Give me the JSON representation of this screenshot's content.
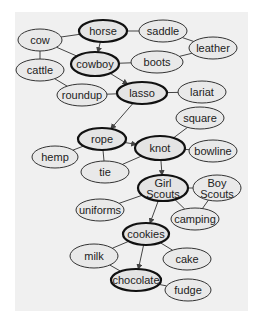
{
  "diagram": {
    "type": "semantic-network",
    "background": "#f0f0f0",
    "nodes": [
      {
        "id": "horse",
        "label": "horse",
        "x": 103,
        "y": 31,
        "rx": 24,
        "ry": 11,
        "bold": true
      },
      {
        "id": "saddle",
        "label": "saddle",
        "x": 163,
        "y": 31,
        "rx": 24,
        "ry": 11,
        "bold": false
      },
      {
        "id": "cow",
        "label": "cow",
        "x": 40,
        "y": 40,
        "rx": 22,
        "ry": 11,
        "bold": false
      },
      {
        "id": "leather",
        "label": "leather",
        "x": 213,
        "y": 48,
        "rx": 24,
        "ry": 11,
        "bold": false
      },
      {
        "id": "cowboy",
        "label": "cowboy",
        "x": 95,
        "y": 64,
        "rx": 24,
        "ry": 12,
        "bold": true
      },
      {
        "id": "boots",
        "label": "boots",
        "x": 157,
        "y": 62,
        "rx": 26,
        "ry": 11,
        "bold": false
      },
      {
        "id": "cattle",
        "label": "cattle",
        "x": 40,
        "y": 70,
        "rx": 24,
        "ry": 11,
        "bold": false
      },
      {
        "id": "roundup",
        "label": "roundup",
        "x": 82,
        "y": 95,
        "rx": 25,
        "ry": 11,
        "bold": false
      },
      {
        "id": "lasso",
        "label": "lasso",
        "x": 142,
        "y": 93,
        "rx": 25,
        "ry": 11,
        "bold": true
      },
      {
        "id": "lariat",
        "label": "lariat",
        "x": 202,
        "y": 92,
        "rx": 24,
        "ry": 11,
        "bold": false
      },
      {
        "id": "square",
        "label": "square",
        "x": 200,
        "y": 118,
        "rx": 24,
        "ry": 11,
        "bold": false
      },
      {
        "id": "rope",
        "label": "rope",
        "x": 102,
        "y": 139,
        "rx": 24,
        "ry": 11,
        "bold": true
      },
      {
        "id": "knot",
        "label": "knot",
        "x": 160,
        "y": 148,
        "rx": 25,
        "ry": 12,
        "bold": true
      },
      {
        "id": "bowline",
        "label": "bowline",
        "x": 213,
        "y": 151,
        "rx": 24,
        "ry": 11,
        "bold": false
      },
      {
        "id": "hemp",
        "label": "hemp",
        "x": 55,
        "y": 157,
        "rx": 23,
        "ry": 11,
        "bold": false
      },
      {
        "id": "tie",
        "label": "tie",
        "x": 105,
        "y": 172,
        "rx": 24,
        "ry": 11,
        "bold": false
      },
      {
        "id": "girlscouts",
        "label": "Girl|Scouts",
        "x": 163,
        "y": 188,
        "rx": 25,
        "ry": 13,
        "bold": true
      },
      {
        "id": "boyscouts",
        "label": "Boy|Scouts",
        "x": 217,
        "y": 188,
        "rx": 24,
        "ry": 13,
        "bold": false
      },
      {
        "id": "uniforms",
        "label": "uniforms",
        "x": 100,
        "y": 210,
        "rx": 24,
        "ry": 11,
        "bold": false
      },
      {
        "id": "camping",
        "label": "camping",
        "x": 195,
        "y": 219,
        "rx": 24,
        "ry": 11,
        "bold": false
      },
      {
        "id": "cookies",
        "label": "cookies",
        "x": 146,
        "y": 234,
        "rx": 23,
        "ry": 11,
        "bold": true
      },
      {
        "id": "milk",
        "label": "milk",
        "x": 94,
        "y": 256,
        "rx": 24,
        "ry": 12,
        "bold": false
      },
      {
        "id": "cake",
        "label": "cake",
        "x": 187,
        "y": 259,
        "rx": 24,
        "ry": 11,
        "bold": false
      },
      {
        "id": "chocolate",
        "label": "chocolate",
        "x": 136,
        "y": 280,
        "rx": 25,
        "ry": 11,
        "bold": true
      },
      {
        "id": "fudge",
        "label": "fudge",
        "x": 188,
        "y": 290,
        "rx": 23,
        "ry": 11,
        "bold": false
      }
    ],
    "edges": [
      {
        "from": "horse",
        "to": "saddle",
        "arrow": false
      },
      {
        "from": "cow",
        "to": "horse",
        "arrow": false
      },
      {
        "from": "saddle",
        "to": "leather",
        "arrow": false
      },
      {
        "from": "horse",
        "to": "cowboy",
        "arrow": true
      },
      {
        "from": "cow",
        "to": "cowboy",
        "arrow": false
      },
      {
        "from": "cow",
        "to": "cattle",
        "arrow": false
      },
      {
        "from": "cowboy",
        "to": "boots",
        "arrow": false
      },
      {
        "from": "boots",
        "to": "leather",
        "arrow": false
      },
      {
        "from": "cattle",
        "to": "roundup",
        "arrow": false
      },
      {
        "from": "cowboy",
        "to": "lasso",
        "arrow": true
      },
      {
        "from": "roundup",
        "to": "lasso",
        "arrow": false
      },
      {
        "from": "lasso",
        "to": "lariat",
        "arrow": false
      },
      {
        "from": "lasso",
        "to": "rope",
        "arrow": true
      },
      {
        "from": "rope",
        "to": "knot",
        "arrow": true
      },
      {
        "from": "rope",
        "to": "hemp",
        "arrow": false
      },
      {
        "from": "rope",
        "to": "tie",
        "arrow": false
      },
      {
        "from": "knot",
        "to": "square",
        "arrow": false
      },
      {
        "from": "knot",
        "to": "bowline",
        "arrow": false
      },
      {
        "from": "knot",
        "to": "tie",
        "arrow": false
      },
      {
        "from": "knot",
        "to": "girlscouts",
        "arrow": true
      },
      {
        "from": "girlscouts",
        "to": "boyscouts",
        "arrow": false
      },
      {
        "from": "girlscouts",
        "to": "uniforms",
        "arrow": false
      },
      {
        "from": "girlscouts",
        "to": "camping",
        "arrow": false
      },
      {
        "from": "boyscouts",
        "to": "camping",
        "arrow": false
      },
      {
        "from": "girlscouts",
        "to": "cookies",
        "arrow": true
      },
      {
        "from": "cookies",
        "to": "milk",
        "arrow": false
      },
      {
        "from": "cookies",
        "to": "cake",
        "arrow": false
      },
      {
        "from": "cookies",
        "to": "chocolate",
        "arrow": true
      },
      {
        "from": "milk",
        "to": "chocolate",
        "arrow": false
      },
      {
        "from": "chocolate",
        "to": "fudge",
        "arrow": false
      }
    ]
  }
}
